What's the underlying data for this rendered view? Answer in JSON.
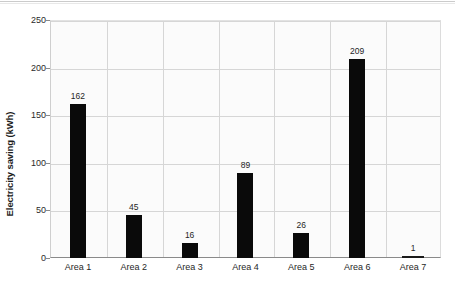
{
  "chart_data": {
    "type": "bar",
    "title": "",
    "xlabel": "",
    "ylabel": "Electricity saving (kWh)",
    "categories": [
      "Area 1",
      "Area 2",
      "Area 3",
      "Area 4",
      "Area 5",
      "Area 6",
      "Area 7"
    ],
    "values": [
      162,
      45,
      16,
      89,
      26,
      209,
      1
    ],
    "data_labels": [
      "162",
      "45",
      "16",
      "89",
      "26",
      "209",
      "1"
    ],
    "ylim": [
      0,
      250
    ],
    "yticks": [
      0,
      50,
      100,
      150,
      200,
      250
    ],
    "ytick_labels": [
      "0",
      "50",
      "100",
      "150",
      "200",
      "250"
    ],
    "grid": "both",
    "legend": "none",
    "bar_color": "#0a0a0a",
    "plot_background": "#fbfbfb",
    "grid_color": "#d6d6d6"
  }
}
